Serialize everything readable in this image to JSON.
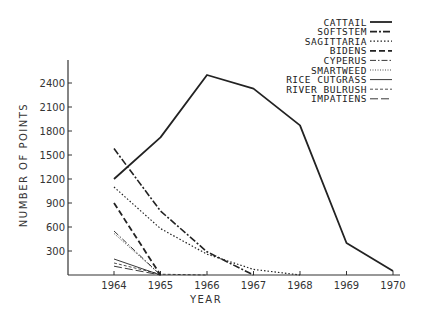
{
  "chart_data": {
    "type": "line",
    "title": "",
    "xlabel": "YEAR",
    "ylabel": "NUMBER OF POINTS",
    "x": [
      1964,
      1965,
      1966,
      1967,
      1968,
      1969,
      1970
    ],
    "xticks": [
      "1964",
      "1965",
      "1966",
      "1967",
      "1968",
      "1969",
      "1970"
    ],
    "yticks": [
      "300",
      "600",
      "900",
      "1200",
      "1500",
      "1800",
      "2100",
      "2400"
    ],
    "ylim": [
      0,
      2700
    ],
    "xlim": [
      1963,
      1970.2
    ],
    "grid": false,
    "legend_position": "top-right",
    "series": [
      {
        "name": "CATTAIL",
        "style": "thick-solid",
        "x": [
          1964,
          1965,
          1966,
          1967,
          1968,
          1969,
          1970
        ],
        "values": [
          1200,
          1720,
          2500,
          2330,
          1870,
          400,
          50
        ]
      },
      {
        "name": "SOFTSTEM",
        "style": "dash-dot",
        "x": [
          1964,
          1965,
          1966,
          1967
        ],
        "values": [
          1580,
          800,
          290,
          0
        ]
      },
      {
        "name": "SAGITTARIA",
        "style": "dotted",
        "x": [
          1964,
          1965,
          1966,
          1967,
          1968
        ],
        "values": [
          1100,
          580,
          260,
          70,
          0
        ]
      },
      {
        "name": "BIDENS",
        "style": "long-dash",
        "x": [
          1964,
          1965
        ],
        "values": [
          900,
          0
        ]
      },
      {
        "name": "CYPERUS",
        "style": "dash-dot-thin",
        "x": [
          1964,
          1965
        ],
        "values": [
          550,
          0
        ]
      },
      {
        "name": "SMARTWEED",
        "style": "fine-dotted",
        "x": [
          1964,
          1965
        ],
        "values": [
          520,
          0
        ]
      },
      {
        "name": "RICE CUTGRASS",
        "style": "thin-solid",
        "x": [
          1964,
          1965
        ],
        "values": [
          200,
          0
        ]
      },
      {
        "name": "RIVER BULRUSH",
        "style": "thin-dash",
        "x": [
          1964,
          1965,
          1966
        ],
        "values": [
          150,
          10,
          0
        ]
      },
      {
        "name": "IMPATIENS",
        "style": "long-dash-thin",
        "x": [
          1964,
          1965
        ],
        "values": [
          110,
          0
        ]
      }
    ]
  }
}
